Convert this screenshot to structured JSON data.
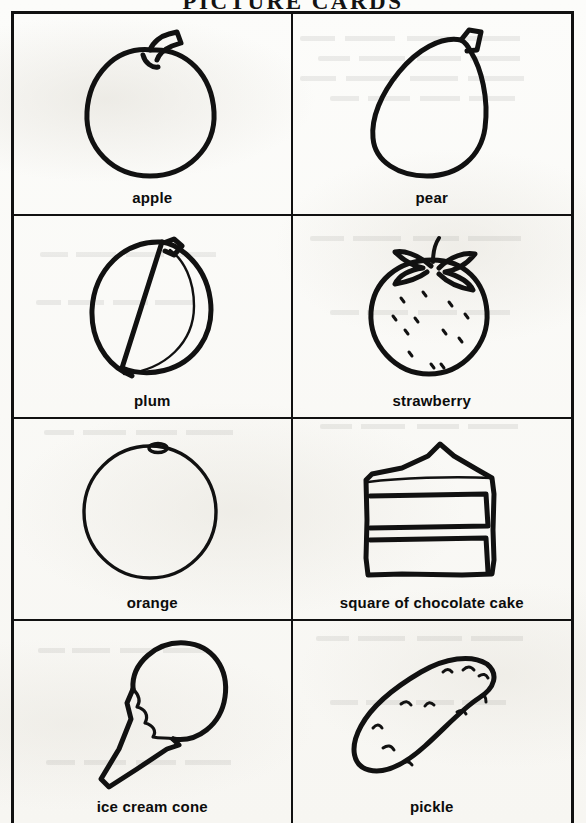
{
  "document": {
    "title": "PICTURE CARDS",
    "type": "worksheet",
    "ink_color": "#111111",
    "paper_color": "#fdfdfb"
  },
  "grid": {
    "columns": 2,
    "rows": 4,
    "cards": [
      {
        "label": "apple",
        "icon": "apple-line-drawing"
      },
      {
        "label": "pear",
        "icon": "pear-line-drawing"
      },
      {
        "label": "plum",
        "icon": "plum-line-drawing"
      },
      {
        "label": "strawberry",
        "icon": "strawberry-line-drawing"
      },
      {
        "label": "orange",
        "icon": "orange-line-drawing"
      },
      {
        "label": "square of chocolate cake",
        "icon": "cake-slice-line-drawing"
      },
      {
        "label": "ice cream cone",
        "icon": "ice-cream-cone-line-drawing"
      },
      {
        "label": "pickle",
        "icon": "pickle-line-drawing"
      }
    ]
  }
}
